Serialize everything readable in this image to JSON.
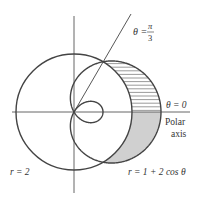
{
  "figure": {
    "scale_px_per_unit": 29,
    "pole": {
      "x": 74,
      "y": 112
    },
    "colors": {
      "stroke": "#444444",
      "axis": "#555555",
      "shade": "#d0d0d0",
      "hatch": "#555555",
      "text": "#333333"
    }
  },
  "curves": [
    {
      "name": "circle",
      "equation_label": "r = 2"
    },
    {
      "name": "limacon",
      "equation_label": "r = 1 + 2 cos θ"
    }
  ],
  "labels": {
    "ray_label_theta": "θ =",
    "ray_label_num": "π",
    "ray_label_den": "3",
    "polar_axis_theta": "θ = 0",
    "polar_axis_word1": "Polar",
    "polar_axis_word2": "axis",
    "circle_label": "r = 2",
    "limacon_label": "r = 1 + 2 cos θ"
  },
  "regions": [
    {
      "name": "hatched-region",
      "from_theta": "0",
      "to_theta": "π/3",
      "style": "horizontal hatching"
    },
    {
      "name": "shaded-region",
      "from_theta": "-π/3",
      "to_theta": "0",
      "style": "gray fill"
    }
  ]
}
